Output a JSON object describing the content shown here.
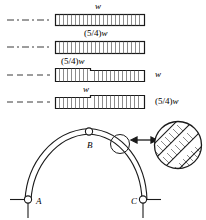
{
  "figure": {
    "line_color": "#1a1a1a",
    "fill_color": "#ffffff"
  },
  "strips": [
    {
      "id": "strip-1",
      "label": "w",
      "label_html": "<i>w</i>",
      "label_pos": "top-center",
      "centerline_style": "dash-dot",
      "x": 55,
      "y": 14,
      "width": 90,
      "height": 11,
      "segments": [
        {
          "x": 55,
          "width": 90,
          "height": 11,
          "ticks": 22
        }
      ]
    },
    {
      "id": "strip-2",
      "label": "(5/4)w",
      "label_html": "(5/4)<i>w</i>",
      "label_pos": "top-center",
      "centerline_style": "dash-dot",
      "x": 55,
      "y": 41,
      "width": 90,
      "height": 13,
      "segments": [
        {
          "x": 55,
          "width": 90,
          "height": 13,
          "ticks": 22
        }
      ]
    },
    {
      "id": "strip-3",
      "label_left": "(5/4)w",
      "label_left_html": "(5/4)<i>w</i>",
      "label_right": "w",
      "label_right_html": "<i>w</i>",
      "centerline_style": "dash",
      "x": 55,
      "y": 69,
      "width": 90,
      "segments": [
        {
          "x": 55,
          "width": 36,
          "height": 13,
          "ticks": 9,
          "thickness": "(5/4)w"
        },
        {
          "x": 91,
          "width": 54,
          "height": 11,
          "ticks": 13,
          "thickness": "w"
        }
      ]
    },
    {
      "id": "strip-4",
      "label_left": "w",
      "label_left_html": "<i>w</i>",
      "label_right": "(5/4)w",
      "label_right_html": "(5/4)<i>w</i>",
      "centerline_style": "dash",
      "x": 55,
      "y": 96,
      "width": 90,
      "segments": [
        {
          "x": 55,
          "width": 36,
          "height": 11,
          "ticks": 9,
          "thickness": "w"
        },
        {
          "x": 91,
          "width": 54,
          "height": 13,
          "ticks": 13,
          "thickness": "(5/4)w"
        }
      ]
    }
  ],
  "arch": {
    "hinges": [
      {
        "name": "A",
        "label": "A",
        "cx": 28,
        "cy": 199,
        "support": "pin",
        "label_dx": 8,
        "label_dy": 3
      },
      {
        "name": "B",
        "label": "B",
        "cx": 89,
        "cy": 131,
        "support": "crown-hinge",
        "label_dx": -2,
        "label_dy": 14
      },
      {
        "name": "C",
        "label": "C",
        "cx": 143,
        "cy": 199,
        "support": "pin",
        "label_dx": -12,
        "label_dy": 3
      }
    ],
    "detail": {
      "callout_circle": {
        "cx": 120,
        "cy": 144,
        "r": 10
      },
      "magnified_circle": {
        "cx": 178,
        "cy": 145,
        "r": 24
      },
      "arrow": {
        "x1": 131,
        "y1": 140,
        "x2": 156,
        "y2": 140,
        "double_headed": true
      },
      "pattern": "diagonal-laminations"
    }
  },
  "icons": {
    "centerline": "centerline-icon",
    "hinge": "pin-hinge-icon",
    "ground": "ground-support-icon",
    "detail_arrow": "double-arrow-icon"
  }
}
